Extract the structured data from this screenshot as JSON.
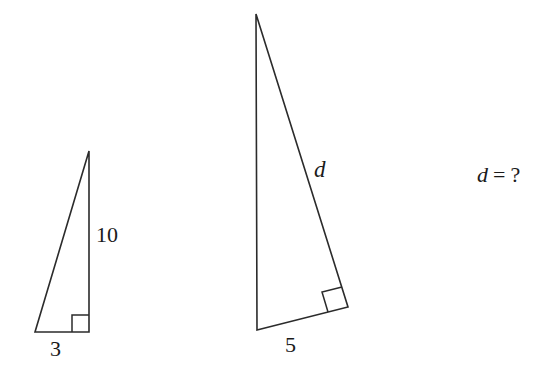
{
  "figure": {
    "background_color": "#ffffff",
    "stroke_color": "#2b2b2b",
    "text_color": "#1a1a1a"
  },
  "shapes": {
    "left_triangle": {
      "name": "small-right-triangle",
      "vertices": {
        "apex": [
          89,
          151
        ],
        "bottom_left": [
          35,
          332
        ],
        "bottom_right": [
          89,
          332
        ]
      },
      "right_angle_vertex": "bottom_right",
      "right_angle_marker_size": 17,
      "labels": {
        "vertical_leg": "10",
        "base_leg": "3"
      }
    },
    "middle_triangle": {
      "name": "large-right-triangle",
      "vertices": {
        "apex": [
          256,
          14
        ],
        "bottom_left": [
          257,
          330
        ],
        "right": [
          348,
          307
        ]
      },
      "right_angle_vertex": "right",
      "right_angle_marker_size": 20,
      "labels": {
        "hypotenuse": "d",
        "base_leg": "5"
      }
    }
  },
  "labels": {
    "left_vertical_leg": "10",
    "left_base_leg": "3",
    "middle_hypotenuse": "d",
    "middle_base_leg": "5"
  },
  "question": {
    "variable": "d",
    "equals": "=",
    "unknown": "?",
    "full_text": "d = ?"
  }
}
